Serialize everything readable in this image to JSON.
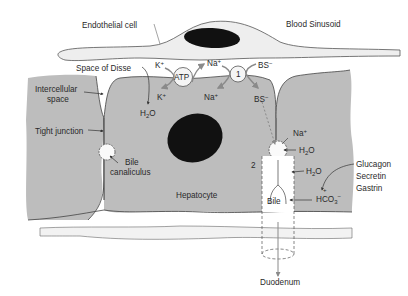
{
  "diagram": {
    "colors": {
      "hepatocyte_fill": "#bdbdbd",
      "endothelial_fill": "#eeeeee",
      "outline": "#4a4a4a",
      "nucleus": "#111111",
      "arrow_gray": "#8a8a8a",
      "text": "#2a2a2a"
    },
    "labels": {
      "endothelial_cell": "Endothelial cell",
      "blood_sinusoid": "Blood Sinusoid",
      "space_of_disse": "Space of Disse",
      "intercellular_space_1": "Intercellular",
      "intercellular_space_2": "space",
      "tight_junction": "Tight junction",
      "bile_canaliculus_1": "Bile",
      "bile_canaliculus_2": "canaliculus",
      "hepatocyte": "Hepatocyte",
      "duodenum": "Duodenum",
      "bile": "Bile",
      "hormones": [
        "Glucagon",
        "Secretin",
        "Gastrin"
      ],
      "atp": "ATP",
      "transporter_1": "1",
      "marker_2": "2"
    },
    "ions": {
      "k_out": "K",
      "k_in": "K",
      "na_out": "Na",
      "na_in": "Na",
      "bs_out": "BS",
      "bs_in": "BS",
      "na_canal": "Na",
      "h2o_left": "H",
      "h2o_canal": "H",
      "h2o_duct": "H",
      "hco3": "HCO",
      "plus": "+",
      "minus": "−",
      "o": "O",
      "sub2": "2",
      "sub3": "3",
      "hco3_plus": "+"
    }
  }
}
